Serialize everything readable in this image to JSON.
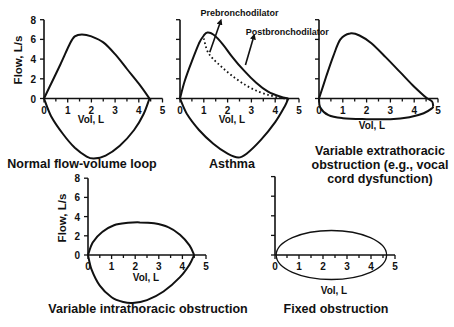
{
  "figure": {
    "y_axis_label": "Flow, L/s",
    "x_axis_label": "Vol, L"
  },
  "chart_data": [
    {
      "id": "normal",
      "type": "line",
      "title": "Normal flow-volume loop",
      "xlabel": "Vol, L",
      "ylabel": "Flow, L/s",
      "xlim": [
        0,
        5
      ],
      "ylim": [
        0,
        8
      ],
      "x_ticks": [
        "0",
        "1",
        "2",
        "3",
        "4",
        "5"
      ],
      "y_ticks": [
        "0",
        "2",
        "4",
        "6",
        "8"
      ],
      "show_y_tick_labels": true,
      "series": [
        {
          "name": "expiratory",
          "style": "solid",
          "points": [
            [
              0,
              0
            ],
            [
              0.3,
              1.5
            ],
            [
              0.7,
              3.5
            ],
            [
              1.1,
              5.6
            ],
            [
              1.3,
              6.3
            ],
            [
              1.6,
              6.5
            ],
            [
              2.0,
              6.3
            ],
            [
              2.5,
              5.7
            ],
            [
              3.0,
              4.5
            ],
            [
              3.5,
              3.0
            ],
            [
              4.0,
              1.5
            ],
            [
              4.45,
              0
            ]
          ]
        },
        {
          "name": "inspiratory",
          "style": "solid",
          "points": [
            [
              0,
              0
            ],
            [
              0.3,
              -1.8
            ],
            [
              0.8,
              -3.6
            ],
            [
              1.3,
              -5.0
            ],
            [
              1.8,
              -5.9
            ],
            [
              2.1,
              -6.1
            ],
            [
              2.6,
              -5.8
            ],
            [
              3.2,
              -4.8
            ],
            [
              3.8,
              -3.2
            ],
            [
              4.2,
              -1.6
            ],
            [
              4.45,
              0
            ]
          ]
        }
      ],
      "annotations": []
    },
    {
      "id": "asthma",
      "type": "line",
      "title": "Asthma",
      "xlabel": "Vol, L",
      "ylabel": "",
      "xlim": [
        0,
        5
      ],
      "ylim": [
        0,
        8
      ],
      "x_ticks": [
        "0",
        "1",
        "2",
        "3",
        "4",
        "5"
      ],
      "y_ticks": [
        "0",
        "2",
        "4",
        "6",
        "8"
      ],
      "show_y_tick_labels": false,
      "series": [
        {
          "name": "Postbronchodilator",
          "style": "solid",
          "points": [
            [
              0,
              0
            ],
            [
              0.2,
              1.8
            ],
            [
              0.5,
              3.8
            ],
            [
              0.8,
              5.6
            ],
            [
              1.0,
              6.4
            ],
            [
              1.15,
              6.7
            ],
            [
              1.4,
              6.5
            ],
            [
              1.8,
              5.5
            ],
            [
              2.2,
              4.2
            ],
            [
              2.7,
              2.8
            ],
            [
              3.2,
              1.6
            ],
            [
              3.7,
              0.7
            ],
            [
              4.2,
              0.2
            ],
            [
              4.55,
              0
            ]
          ]
        },
        {
          "name": "Prebronchodilator",
          "style": "dotted",
          "points": [
            [
              1.0,
              6.1
            ],
            [
              1.15,
              4.8
            ],
            [
              1.4,
              4.0
            ],
            [
              1.8,
              3.1
            ],
            [
              2.3,
              2.1
            ],
            [
              2.8,
              1.3
            ],
            [
              3.3,
              0.7
            ],
            [
              3.8,
              0.3
            ],
            [
              4.2,
              0.05
            ],
            [
              4.5,
              0
            ]
          ]
        },
        {
          "name": "inspiratory",
          "style": "solid",
          "points": [
            [
              0,
              0
            ],
            [
              0.3,
              -1.6
            ],
            [
              0.8,
              -3.2
            ],
            [
              1.4,
              -4.6
            ],
            [
              2.0,
              -5.6
            ],
            [
              2.45,
              -6.0
            ],
            [
              2.8,
              -5.6
            ],
            [
              3.4,
              -4.2
            ],
            [
              4.0,
              -2.4
            ],
            [
              4.4,
              -0.8
            ],
            [
              4.55,
              0
            ]
          ]
        }
      ],
      "annotations": [
        {
          "text": "Prebronchodilator",
          "arrow_from": [
            1.25,
            4.7
          ],
          "arrow_to": [
            1.7,
            7.8
          ]
        },
        {
          "text": "Postbronchodilator",
          "arrow_from": [
            2.75,
            3.4
          ],
          "arrow_to": [
            3.1,
            6.3
          ]
        }
      ]
    },
    {
      "id": "extrathoracic",
      "type": "line",
      "title": "Variable extrathoracic obstruction (e.g., vocal cord dysfunction)",
      "title_lines": [
        "Variable extrathoracic",
        "obstruction (e.g., vocal",
        "cord dysfunction)"
      ],
      "xlabel": "Vol, L",
      "ylabel": "",
      "xlim": [
        0,
        5
      ],
      "ylim": [
        0,
        8
      ],
      "x_ticks": [
        "0",
        "1",
        "2",
        "3",
        "4",
        "5"
      ],
      "y_ticks": [
        "0",
        "2",
        "4",
        "6",
        "8"
      ],
      "show_y_tick_labels": false,
      "series": [
        {
          "name": "expiratory",
          "style": "solid",
          "points": [
            [
              0,
              0
            ],
            [
              0.3,
              2.2
            ],
            [
              0.6,
              4.3
            ],
            [
              0.9,
              6.0
            ],
            [
              1.3,
              6.6
            ],
            [
              1.7,
              6.4
            ],
            [
              2.2,
              5.6
            ],
            [
              2.8,
              4.2
            ],
            [
              3.4,
              2.7
            ],
            [
              4.0,
              1.2
            ],
            [
              4.5,
              0.1
            ],
            [
              4.75,
              -0.3
            ],
            [
              4.8,
              -0.8
            ]
          ]
        },
        {
          "name": "inspiratory",
          "style": "solid",
          "points": [
            [
              0,
              0
            ],
            [
              0.05,
              -0.9
            ],
            [
              0.4,
              -1.7
            ],
            [
              1.0,
              -2.0
            ],
            [
              2.0,
              -2.1
            ],
            [
              3.0,
              -2.1
            ],
            [
              3.8,
              -1.9
            ],
            [
              4.4,
              -1.5
            ],
            [
              4.75,
              -1.0
            ],
            [
              4.8,
              -0.8
            ]
          ]
        }
      ],
      "annotations": []
    },
    {
      "id": "intrathoracic",
      "type": "line",
      "title": "Variable intrathoracic obstruction",
      "xlabel": "Vol, L",
      "ylabel": "Flow, L/s",
      "xlim": [
        0,
        5
      ],
      "ylim": [
        0,
        8
      ],
      "x_ticks": [
        "0",
        "1",
        "2",
        "3",
        "4",
        "5"
      ],
      "y_ticks": [
        "0",
        "2",
        "4",
        "6",
        "8"
      ],
      "show_y_tick_labels": true,
      "series": [
        {
          "name": "expiratory",
          "style": "solid",
          "points": [
            [
              0,
              0
            ],
            [
              0.2,
              1.3
            ],
            [
              0.6,
              2.4
            ],
            [
              1.1,
              3.1
            ],
            [
              1.7,
              3.35
            ],
            [
              2.2,
              3.4
            ],
            [
              2.8,
              3.3
            ],
            [
              3.4,
              2.9
            ],
            [
              3.9,
              2.1
            ],
            [
              4.3,
              1.0
            ],
            [
              4.5,
              0
            ]
          ]
        },
        {
          "name": "inspiratory",
          "style": "solid",
          "points": [
            [
              0,
              0
            ],
            [
              0.15,
              -1.5
            ],
            [
              0.5,
              -3.2
            ],
            [
              1.0,
              -4.4
            ],
            [
              1.5,
              -4.9
            ],
            [
              1.9,
              -5.0
            ],
            [
              2.5,
              -4.7
            ],
            [
              3.2,
              -3.8
            ],
            [
              3.9,
              -2.3
            ],
            [
              4.3,
              -1.0
            ],
            [
              4.5,
              0
            ]
          ]
        }
      ],
      "annotations": []
    },
    {
      "id": "fixed",
      "type": "line",
      "title": "Fixed obstruction",
      "xlabel": "Vol, L",
      "ylabel": "",
      "xlim": [
        0,
        5
      ],
      "ylim": [
        0,
        8
      ],
      "x_ticks": [
        "0",
        "1",
        "2",
        "3",
        "4",
        "5"
      ],
      "y_ticks": [
        "0",
        "2",
        "4",
        "6",
        "8"
      ],
      "show_y_tick_labels": false,
      "series": [
        {
          "name": "loop",
          "style": "solid-thin",
          "ellipse": {
            "cx": 2.35,
            "cy": 0,
            "rx": 2.3,
            "ry": 2.5
          }
        }
      ],
      "annotations": []
    }
  ]
}
